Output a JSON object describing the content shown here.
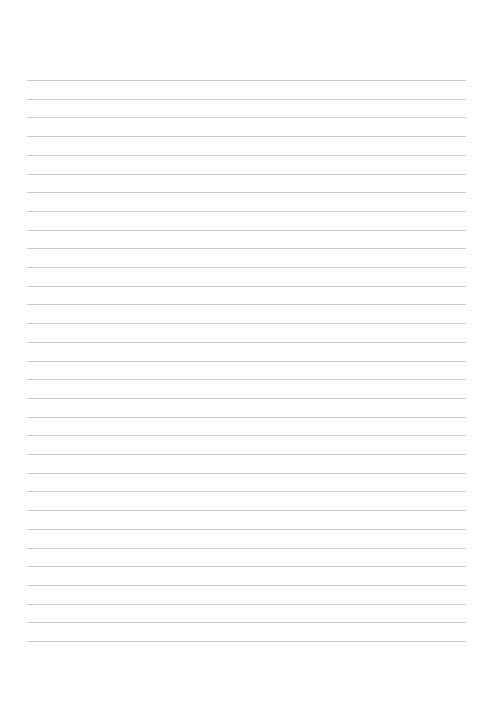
{
  "document": {
    "type": "blank lined paper",
    "line_count": 31,
    "line_color": "#c4c4c4",
    "background_color": "#ffffff"
  }
}
